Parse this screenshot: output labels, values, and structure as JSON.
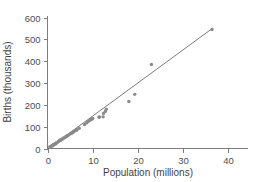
{
  "chart_data": {
    "type": "scatter",
    "title": "",
    "xlabel": "Population (millions)",
    "ylabel": "Births (thousands)",
    "xlim": [
      -1.5,
      45
    ],
    "ylim": [
      -30,
      640
    ],
    "xticks": [
      0,
      10,
      20,
      30,
      40
    ],
    "yticks": [
      0,
      100,
      200,
      300,
      400,
      500,
      600
    ],
    "xtick_labels": [
      "0",
      "10",
      "20",
      "30",
      "40"
    ],
    "ytick_labels": [
      "0",
      "100",
      "200",
      "300",
      "400",
      "500",
      "600"
    ],
    "grid": false,
    "legend": false,
    "point_color": "#8a8a8a",
    "line_color": "#7b7b7b",
    "axis_color": "#7d7d7d",
    "background": "#ffffff",
    "series": [
      {
        "name": "States",
        "marker": "circle",
        "x": [
          0.5,
          0.6,
          0.8,
          0.9,
          1.0,
          1.1,
          1.2,
          1.3,
          1.3,
          1.5,
          1.7,
          1.8,
          1.8,
          2.0,
          2.3,
          2.5,
          2.6,
          2.7,
          2.8,
          2.9,
          3.0,
          3.3,
          3.4,
          3.5,
          3.7,
          4.0,
          4.1,
          4.3,
          4.4,
          4.5,
          4.8,
          5.1,
          5.3,
          5.4,
          5.6,
          5.7,
          5.9,
          6.1,
          6.3,
          6.4,
          6.5,
          7.0,
          8.2,
          8.7,
          9.1,
          9.4,
          9.7,
          9.9,
          10.0,
          11.4,
          11.5,
          12.3,
          12.4,
          12.8,
          13.0,
          18.0,
          19.3,
          23.0,
          36.4
        ],
        "y": [
          7,
          8,
          10,
          11,
          12,
          13,
          15,
          16,
          18,
          19,
          21,
          22,
          24,
          25,
          30,
          33,
          35,
          36,
          38,
          39,
          40,
          44,
          45,
          47,
          49,
          53,
          55,
          57,
          58,
          60,
          64,
          68,
          70,
          72,
          75,
          76,
          79,
          82,
          84,
          85,
          86,
          93,
          110,
          118,
          125,
          130,
          133,
          136,
          138,
          143,
          145,
          145,
          160,
          170,
          180,
          215,
          248,
          385,
          545
        ]
      }
    ],
    "trend_line": {
      "name": "fitted line",
      "x_start": 0.2,
      "y_start": 0,
      "x_end": 36.6,
      "y_end": 552
    }
  }
}
